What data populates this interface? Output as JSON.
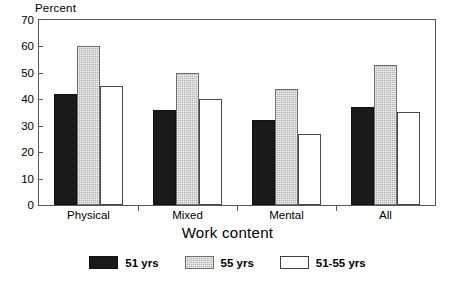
{
  "chart_data": {
    "type": "bar",
    "title": "",
    "subtitle": "",
    "xlabel": "Work content",
    "ylabel": "Percent",
    "categories": [
      "Physical",
      "Mixed",
      "Mental",
      "All"
    ],
    "series": [
      {
        "name": "51 yrs",
        "color": "#1a1a1a",
        "values": [
          42,
          36,
          32,
          37
        ]
      },
      {
        "name": "55 yrs",
        "color": "#b4b4b4",
        "values": [
          60,
          50,
          44,
          53
        ]
      },
      {
        "name": "51-55 yrs",
        "color": "#ffffff",
        "values": [
          45,
          40,
          27,
          35
        ]
      }
    ],
    "ylim": [
      0,
      70
    ],
    "yticks": [
      0,
      10,
      20,
      30,
      40,
      50,
      60,
      70
    ],
    "ytick_labels": [
      "0",
      "10",
      "20",
      "30",
      "40",
      "50",
      "60",
      "70"
    ],
    "grid": false,
    "legend_position": "bottom"
  }
}
